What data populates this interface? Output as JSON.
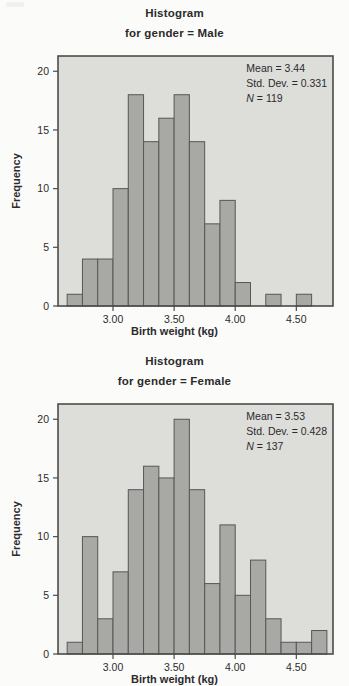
{
  "page": {
    "background": "#fbfbf9"
  },
  "colors": {
    "plot_bg": "#ddddda",
    "bar_fill": "#a8a8a5",
    "bar_border": "#57575a",
    "frame": "#4c4c4a",
    "text": "#2b2b2d"
  },
  "chart_data": [
    {
      "type": "bar",
      "title": "Histogram",
      "subtitle": "for gender = Male",
      "xlabel": "Birth weight (kg)",
      "ylabel": "Frequency",
      "bin_start": 2.625,
      "bin_width": 0.125,
      "frequencies": [
        1,
        4,
        4,
        10,
        18,
        14,
        16,
        18,
        14,
        7,
        9,
        2,
        0,
        1,
        0,
        1
      ],
      "xlim": [
        2.55,
        4.8
      ],
      "ylim": [
        0,
        21.3
      ],
      "xticks": [
        3.0,
        3.5,
        4.0,
        4.5
      ],
      "xtick_labels": [
        "3.00",
        "3.50",
        "4.00",
        "4.50"
      ],
      "yticks": [
        0,
        5,
        10,
        15,
        20
      ],
      "grid": false,
      "legend": "none",
      "stats": {
        "mean": "Mean = 3.44",
        "std": "Std. Dev. = 0.331",
        "n_name": "N",
        "n_value": " = 119"
      }
    },
    {
      "type": "bar",
      "title": "Histogram",
      "subtitle": "for gender = Female",
      "xlabel": "Birth weight (kg)",
      "ylabel": "Frequency",
      "bin_start": 2.625,
      "bin_width": 0.125,
      "frequencies": [
        1,
        10,
        3,
        7,
        14,
        16,
        15,
        20,
        14,
        6,
        11,
        5,
        8,
        3,
        1,
        1,
        2
      ],
      "xlim": [
        2.55,
        4.8
      ],
      "ylim": [
        0,
        21.3
      ],
      "xticks": [
        3.0,
        3.5,
        4.0,
        4.5
      ],
      "xtick_labels": [
        "3.00",
        "3.50",
        "4.00",
        "4.50"
      ],
      "yticks": [
        0,
        5,
        10,
        15,
        20
      ],
      "grid": false,
      "legend": "none",
      "stats": {
        "mean": "Mean = 3.53",
        "std": "Std. Dev. = 0.428",
        "n_name": "N",
        "n_value": " = 137"
      }
    }
  ]
}
